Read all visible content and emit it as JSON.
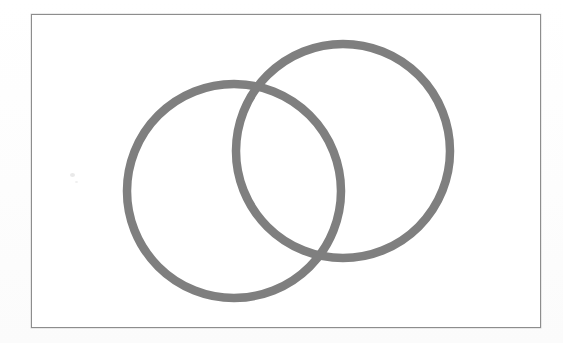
{
  "image": {
    "kind": "scanned-line-drawing",
    "width": 563,
    "height": 343,
    "page_background": "#fefefe",
    "alt_text": "Two overlapping gray circle outlines inside a thin rectangular border"
  },
  "frame": {
    "name": "figure-border",
    "x": 31,
    "y": 14,
    "width": 510,
    "height": 314,
    "border_color": "#8d8d8d",
    "border_width_px": 1,
    "fill": "#ffffff"
  },
  "figure": {
    "title": "",
    "caption": "",
    "stroke_color": "#7f7f7f",
    "stroke_width_px": 8.5,
    "fill": "none",
    "overlap_style": "simple-overlap",
    "shapes": [
      {
        "id": "circle-left",
        "label": "left circle",
        "type": "circle",
        "cx": 234,
        "cy": 191,
        "r": 107,
        "stroke": "#7f7f7f",
        "stroke_width": 8.5
      },
      {
        "id": "circle-right",
        "label": "right circle",
        "type": "circle",
        "cx": 343,
        "cy": 151,
        "r": 107,
        "stroke": "#7f7f7f",
        "stroke_width": 8.5
      }
    ],
    "intersections": [
      {
        "id": "intersection-upper",
        "x": 247,
        "y": 98
      },
      {
        "id": "intersection-lower",
        "x": 330,
        "y": 244
      }
    ],
    "artifacts": [
      {
        "id": "scan-speck-a",
        "x": 70,
        "y": 173,
        "color": "#e9e9e9"
      },
      {
        "id": "scan-speck-b",
        "x": 75,
        "y": 181,
        "color": "#f0f0f0"
      }
    ]
  }
}
